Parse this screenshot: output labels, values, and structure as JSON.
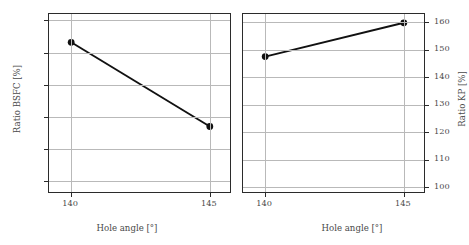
{
  "chart_data": [
    {
      "type": "line",
      "panel": "left",
      "title": "",
      "xlabel": "Hole angle [°]",
      "ylabel": "Ratio BSFC [%]",
      "x": [
        140,
        145
      ],
      "values": [
        99.66,
        98.35
      ],
      "xticks": [
        "140",
        "145"
      ],
      "xtick_values": [
        140,
        145
      ],
      "yticks": [
        "100",
        "99.5",
        "99.0",
        "98.5",
        "98.0",
        "97.5"
      ],
      "ytick_values": [
        100,
        99.5,
        99.0,
        98.5,
        98.0,
        97.5
      ],
      "xlim": [
        139.2,
        145.8
      ],
      "ylim": [
        97.3,
        100.1
      ],
      "grid": true,
      "legend": "none",
      "yaxis_side": "left",
      "marker": "filled-circle",
      "line_color": "#111111"
    },
    {
      "type": "line",
      "panel": "right",
      "title": "",
      "xlabel": "Hole angle [°]",
      "ylabel": "Ratio KP [%]",
      "x": [
        140,
        145
      ],
      "values": [
        147.5,
        159.8
      ],
      "xticks": [
        "140",
        "145"
      ],
      "xtick_values": [
        140,
        145
      ],
      "yticks": [
        "160",
        "150",
        "140",
        "130",
        "120",
        "110",
        "100"
      ],
      "ytick_values": [
        160,
        150,
        140,
        130,
        120,
        110,
        100
      ],
      "xlim": [
        139.2,
        145.8
      ],
      "ylim": [
        97.5,
        163.0
      ],
      "grid": true,
      "legend": "none",
      "yaxis_side": "right",
      "marker": "filled-circle",
      "line_color": "#111111"
    }
  ],
  "colors": {
    "line": "#111111",
    "grid": "#b9b9b9",
    "frame": "#2b2b2b",
    "text": "#4a4a4a",
    "background": "#ffffff"
  }
}
